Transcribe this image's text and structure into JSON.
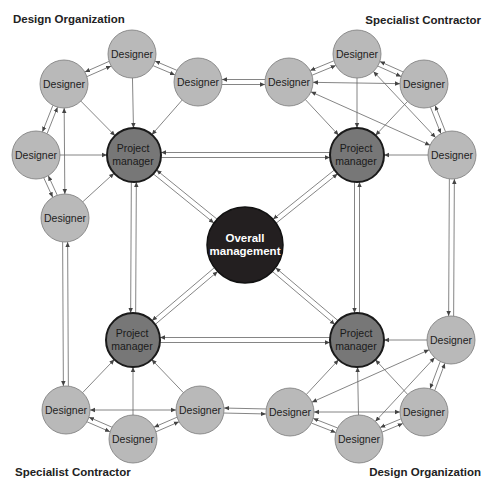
{
  "labels": {
    "top_left": "Design Organization",
    "top_right": "Specialist Contractor",
    "bottom_left": "Specialist Contractor",
    "bottom_right": "Design Organization"
  },
  "colors": {
    "designer_fill": "#b9b9b9",
    "designer_stroke": "#7a7a7a",
    "pm_fill": "#777777",
    "pm_stroke": "#1a1a1a",
    "overall_fill": "#231f20",
    "overall_text": "#ffffff",
    "line": "#555555"
  },
  "center": {
    "line1": "Overall",
    "line2": "management"
  },
  "pm_label": {
    "line1": "Project",
    "line2": "manager"
  },
  "designer_label": "Designer",
  "clusters": [
    {
      "name": "Design Organization",
      "position": "top-left",
      "pm": "Project manager",
      "designers": 5
    },
    {
      "name": "Specialist Contractor",
      "position": "top-right",
      "pm": "Project manager",
      "designers": 4
    },
    {
      "name": "Specialist Contractor",
      "position": "bottom-left",
      "pm": "Project manager",
      "designers": 3
    },
    {
      "name": "Design Organization",
      "position": "bottom-right",
      "pm": "Project manager",
      "designers": 4
    }
  ]
}
